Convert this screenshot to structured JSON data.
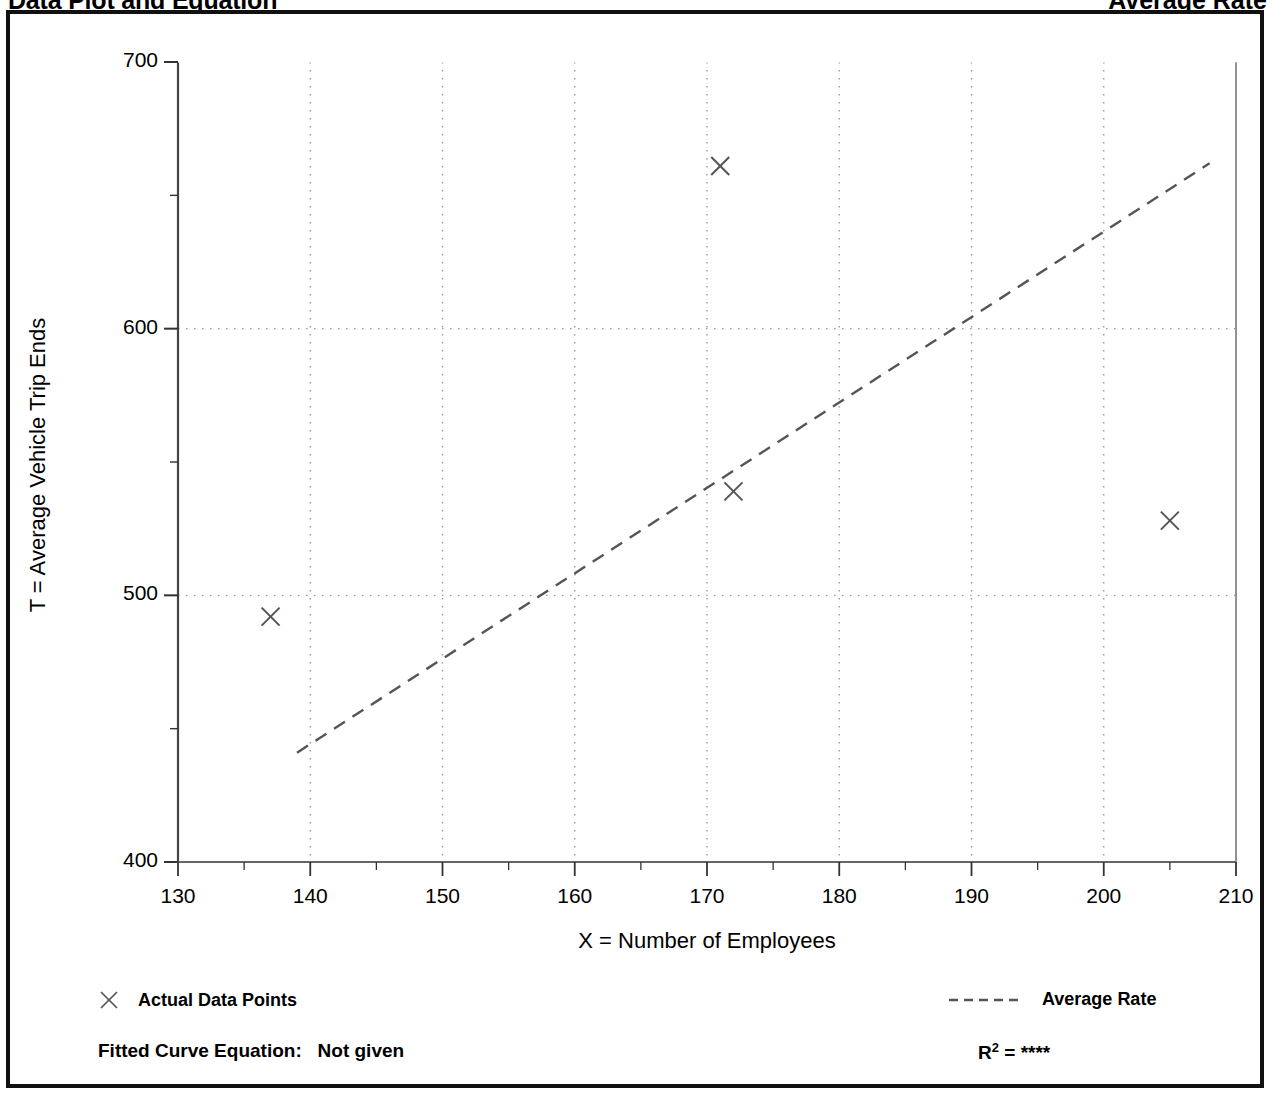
{
  "header": {
    "title": "Data Plot and Equation",
    "right_title": "Average Rate"
  },
  "footer": {
    "equation_label": "Fitted Curve Equation:",
    "equation_value": "Not given",
    "r_squared_label": "R",
    "r_squared_exp": "2",
    "r_squared_eq": "=",
    "r_squared_value": "****"
  },
  "legend": {
    "data_points_label": "Actual Data Points",
    "average_rate_label": "Average Rate",
    "marker_icon": "x-marker-icon",
    "line_icon": "dashed-line-icon"
  },
  "chart_data": {
    "type": "scatter",
    "title": "Data Plot and Equation",
    "xlabel": "X = Number of Employees",
    "ylabel": "T = Average Vehicle Trip Ends",
    "xlim": [
      130,
      210
    ],
    "ylim": [
      400,
      700
    ],
    "xticks": [
      130,
      140,
      150,
      160,
      170,
      180,
      190,
      200,
      210
    ],
    "yticks": [
      400,
      500,
      600,
      700
    ],
    "y_minor_ticks": [
      450,
      550,
      650
    ],
    "grid": {
      "vertical": "dotted",
      "horizontal": "dotted",
      "horizontal_lines": [
        500,
        600
      ]
    },
    "legend_position": "below-plot",
    "series": [
      {
        "name": "Actual Data Points",
        "type": "scatter",
        "marker": "x",
        "color": "#555555",
        "points": [
          {
            "x": 137,
            "y": 492
          },
          {
            "x": 171,
            "y": 661
          },
          {
            "x": 172,
            "y": 539
          },
          {
            "x": 205,
            "y": 528
          }
        ]
      },
      {
        "name": "Average Rate",
        "type": "line",
        "style": "dashed",
        "color": "#555555",
        "points": [
          {
            "x": 139,
            "y": 441
          },
          {
            "x": 208,
            "y": 662
          }
        ]
      }
    ]
  }
}
